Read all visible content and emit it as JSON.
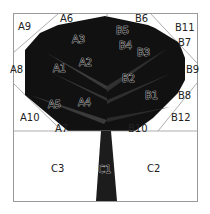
{
  "diagram": {
    "colors": {
      "canopy": "#111111",
      "branch": "#3a3a3a",
      "trunk": "#1c1c1c",
      "background": "#ffffff",
      "border": "#999999"
    },
    "labels": {
      "A1": "A1",
      "A2": "A2",
      "A3": "A3",
      "A4": "A4",
      "A5": "A5",
      "A6": "A6",
      "A7": "A7",
      "A8": "A8",
      "A9": "A9",
      "A10": "A10",
      "B1": "B1",
      "B2": "B2",
      "B3": "B3",
      "B4": "B4",
      "B5": "B5",
      "B6": "B6",
      "B7": "B7",
      "B8": "B8",
      "B9": "B9",
      "B10": "B10",
      "B11": "B11",
      "B12": "B12",
      "C1": "C1",
      "C2": "C2",
      "C3": "C3"
    }
  }
}
